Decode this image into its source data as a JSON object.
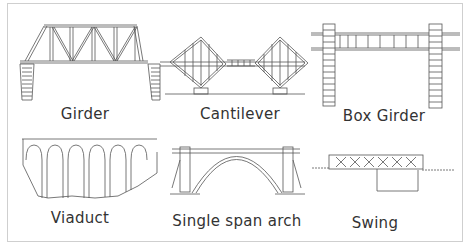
{
  "diagram": {
    "title": "",
    "panels": [
      {
        "id": "girder",
        "label": "Girder"
      },
      {
        "id": "cantilever",
        "label": "Cantilever"
      },
      {
        "id": "box-girder",
        "label": "Box Girder"
      },
      {
        "id": "viaduct",
        "label": "Viaduct"
      },
      {
        "id": "single-span-arch",
        "label": "Single span arch"
      },
      {
        "id": "swing",
        "label": "Swing"
      }
    ],
    "colors": {
      "line": "#555555",
      "frame": "#cfcfcf",
      "background": "#ffffff"
    }
  }
}
